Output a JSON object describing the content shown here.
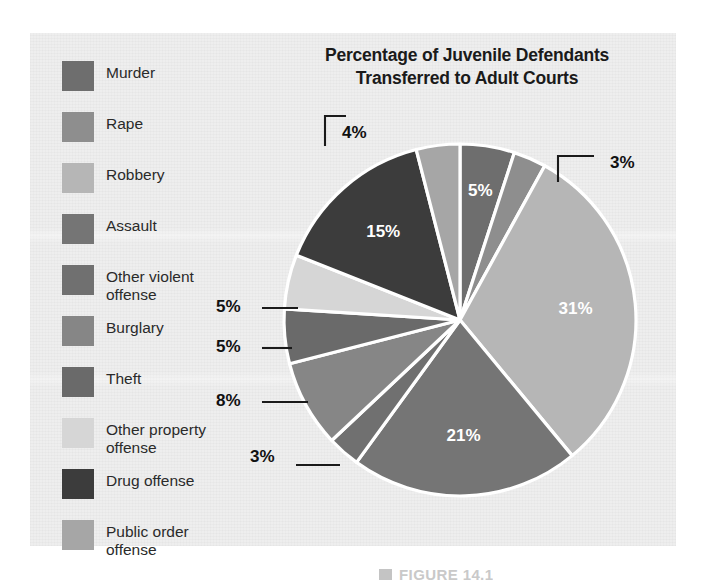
{
  "figure": {
    "title_line1": "Percentage of Juvenile Defendants",
    "title_line2": "Transferred to Adult Courts",
    "caption_marker": "figure-marker",
    "caption": "FIGURE 14.1"
  },
  "legend": {
    "items": [
      {
        "label": "Murder",
        "color": "#6e6e6e",
        "swatch_name": "legend-swatch-murder"
      },
      {
        "label": "Rape",
        "color": "#8e8e8e",
        "swatch_name": "legend-swatch-rape"
      },
      {
        "label": "Robbery",
        "color": "#b6b6b6",
        "swatch_name": "legend-swatch-robbery"
      },
      {
        "label": "Assault",
        "color": "#757575",
        "swatch_name": "legend-swatch-assault"
      },
      {
        "label": "Other violent\noffense",
        "color": "#707070",
        "swatch_name": "legend-swatch-other-violent-offense"
      },
      {
        "label": "Burglary",
        "color": "#868686",
        "swatch_name": "legend-swatch-burglary"
      },
      {
        "label": "Theft",
        "color": "#6a6a6a",
        "swatch_name": "legend-swatch-theft"
      },
      {
        "label": "Other property\noffense",
        "color": "#d6d6d6",
        "swatch_name": "legend-swatch-other-property-offense"
      },
      {
        "label": "Drug offense",
        "color": "#3c3c3c",
        "swatch_name": "legend-swatch-drug-offense"
      },
      {
        "label": "Public order\noffense",
        "color": "#a6a6a6",
        "swatch_name": "legend-swatch-public-order-offense"
      }
    ]
  },
  "chart_data": {
    "type": "pie",
    "title": "Percentage of Juvenile Defendants Transferred to Adult Courts",
    "xlabel": "",
    "ylabel": "",
    "legend_position": "left",
    "start_angle_deg": 0,
    "direction": "clockwise",
    "value_unit": "%",
    "categories": [
      "Murder",
      "Rape",
      "Robbery",
      "Assault",
      "Other violent offense",
      "Burglary",
      "Theft",
      "Other property offense",
      "Drug offense",
      "Public order offense"
    ],
    "values": [
      5,
      3,
      31,
      21,
      3,
      8,
      5,
      5,
      15,
      4
    ],
    "labels": [
      "5%",
      "3%",
      "31%",
      "21%",
      "3%",
      "8%",
      "5%",
      "5%",
      "15%",
      "4%"
    ],
    "colors": [
      "#6e6e6e",
      "#8e8e8e",
      "#b6b6b6",
      "#757575",
      "#707070",
      "#868686",
      "#6a6a6a",
      "#d6d6d6",
      "#3c3c3c",
      "#a6a6a6"
    ],
    "label_placement": [
      "inside",
      "callout",
      "inside",
      "inside",
      "callout",
      "callout",
      "callout",
      "callout",
      "inside",
      "callout"
    ],
    "slices": [
      {
        "name": "Murder",
        "value": 5,
        "label": "5%",
        "color": "#6e6e6e",
        "placement": "inside"
      },
      {
        "name": "Rape",
        "value": 3,
        "label": "3%",
        "color": "#8e8e8e",
        "placement": "callout"
      },
      {
        "name": "Robbery",
        "value": 31,
        "label": "31%",
        "color": "#b6b6b6",
        "placement": "inside"
      },
      {
        "name": "Assault",
        "value": 21,
        "label": "21%",
        "color": "#757575",
        "placement": "inside"
      },
      {
        "name": "Other violent offense",
        "value": 3,
        "label": "3%",
        "color": "#707070",
        "placement": "callout"
      },
      {
        "name": "Burglary",
        "value": 8,
        "label": "8%",
        "color": "#868686",
        "placement": "callout"
      },
      {
        "name": "Theft",
        "value": 5,
        "label": "5%",
        "color": "#6a6a6a",
        "placement": "callout"
      },
      {
        "name": "Other property offense",
        "value": 5,
        "label": "5%",
        "color": "#d6d6d6",
        "placement": "callout"
      },
      {
        "name": "Drug offense",
        "value": 15,
        "label": "15%",
        "color": "#3c3c3c",
        "placement": "inside"
      },
      {
        "name": "Public order offense",
        "value": 4,
        "label": "4%",
        "color": "#a6a6a6",
        "placement": "callout"
      }
    ],
    "total": 100,
    "slice_border_color": "#ffffff",
    "inside_label_color": "#ffffff",
    "callout_label_color": "#111111"
  },
  "colors": {
    "panel_background": "#eeeeee",
    "page_background": "#ffffff",
    "title": "#1a1a1a",
    "legend_text": "#2a2a2a",
    "caption": "#c9c9c9"
  }
}
